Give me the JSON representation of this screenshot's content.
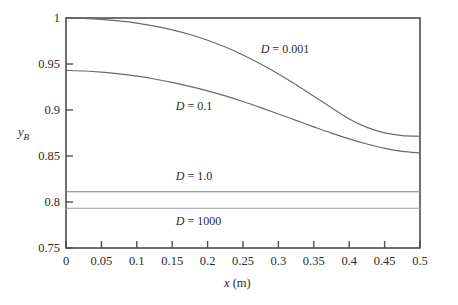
{
  "chart_data": {
    "type": "line",
    "title": "",
    "xlabel": "x (m)",
    "ylabel": "yB",
    "xlim": [
      0,
      0.5
    ],
    "ylim": [
      0.75,
      1.0
    ],
    "grid": false,
    "legend_position": "inline-annotations",
    "xticks": [
      "0",
      "0.05",
      "0.1",
      "0.15",
      "0.2",
      "0.25",
      "0.3",
      "0.35",
      "0.4",
      "0.45",
      "0.5"
    ],
    "xtick_values": [
      0,
      0.05,
      0.1,
      0.15,
      0.2,
      0.25,
      0.3,
      0.35,
      0.4,
      0.45,
      0.5
    ],
    "yticks": [
      "1",
      "0.95",
      "0.9",
      "0.85",
      "0.8",
      "0.75"
    ],
    "ytick_values": [
      1.0,
      0.95,
      0.9,
      0.85,
      0.8,
      0.75
    ],
    "x": [
      0,
      0.025,
      0.05,
      0.075,
      0.1,
      0.125,
      0.15,
      0.175,
      0.2,
      0.225,
      0.25,
      0.275,
      0.3,
      0.325,
      0.35,
      0.375,
      0.4,
      0.425,
      0.45,
      0.475,
      0.5
    ],
    "series": [
      {
        "name": "D = 0.001",
        "label": "D = 0.001",
        "color": "#6a6a6a",
        "values": [
          1.0,
          0.9995,
          0.9985,
          0.9968,
          0.9944,
          0.9912,
          0.9871,
          0.982,
          0.9758,
          0.9684,
          0.9598,
          0.95,
          0.9391,
          0.9274,
          0.915,
          0.9024,
          0.8903,
          0.8811,
          0.8752,
          0.8722,
          0.8715
        ]
      },
      {
        "name": "D = 0.1",
        "label": "D = 0.1",
        "color": "#6a6a6a",
        "values": [
          0.943,
          0.9424,
          0.9412,
          0.9393,
          0.9368,
          0.9337,
          0.93,
          0.9257,
          0.9208,
          0.9153,
          0.9092,
          0.9026,
          0.8957,
          0.8887,
          0.8817,
          0.8749,
          0.8686,
          0.863,
          0.8583,
          0.855,
          0.8533
        ]
      },
      {
        "name": "D = 1.0",
        "label": "D = 1.0",
        "color": "#7d7d7d",
        "values": [
          0.8112,
          0.8112,
          0.8112,
          0.8112,
          0.8112,
          0.8112,
          0.8112,
          0.8112,
          0.8112,
          0.8112,
          0.8112,
          0.8112,
          0.8112,
          0.8112,
          0.8112,
          0.8112,
          0.8112,
          0.8112,
          0.8112,
          0.8112,
          0.8112
        ]
      },
      {
        "name": "D = 1000",
        "label": "D = 1000",
        "color": "#9a9a9a",
        "values": [
          0.7932,
          0.7932,
          0.7932,
          0.7932,
          0.7932,
          0.7932,
          0.7932,
          0.7932,
          0.7932,
          0.7932,
          0.7932,
          0.7932,
          0.7932,
          0.7932,
          0.7932,
          0.7932,
          0.7932,
          0.7932,
          0.7932,
          0.7932,
          0.7932
        ]
      }
    ],
    "annotations": [
      {
        "text": "D = 0.001",
        "symbol": "D",
        "value": "= 0.001",
        "x": 0.275,
        "y": 0.965
      },
      {
        "text": "D = 0.1",
        "symbol": "D",
        "value": "= 0.1",
        "x": 0.155,
        "y": 0.903
      },
      {
        "text": "D = 1.0",
        "symbol": "D",
        "value": "= 1.0",
        "x": 0.155,
        "y": 0.827
      },
      {
        "text": "D = 1000",
        "symbol": "D",
        "value": "= 1000",
        "x": 0.155,
        "y": 0.778
      }
    ]
  },
  "axes": {
    "frame_color": "#4d4d4d",
    "x_axis_title_var": "x",
    "x_axis_title_unit": "(m)",
    "y_axis_title_var": "y",
    "y_axis_title_sub": "B"
  }
}
